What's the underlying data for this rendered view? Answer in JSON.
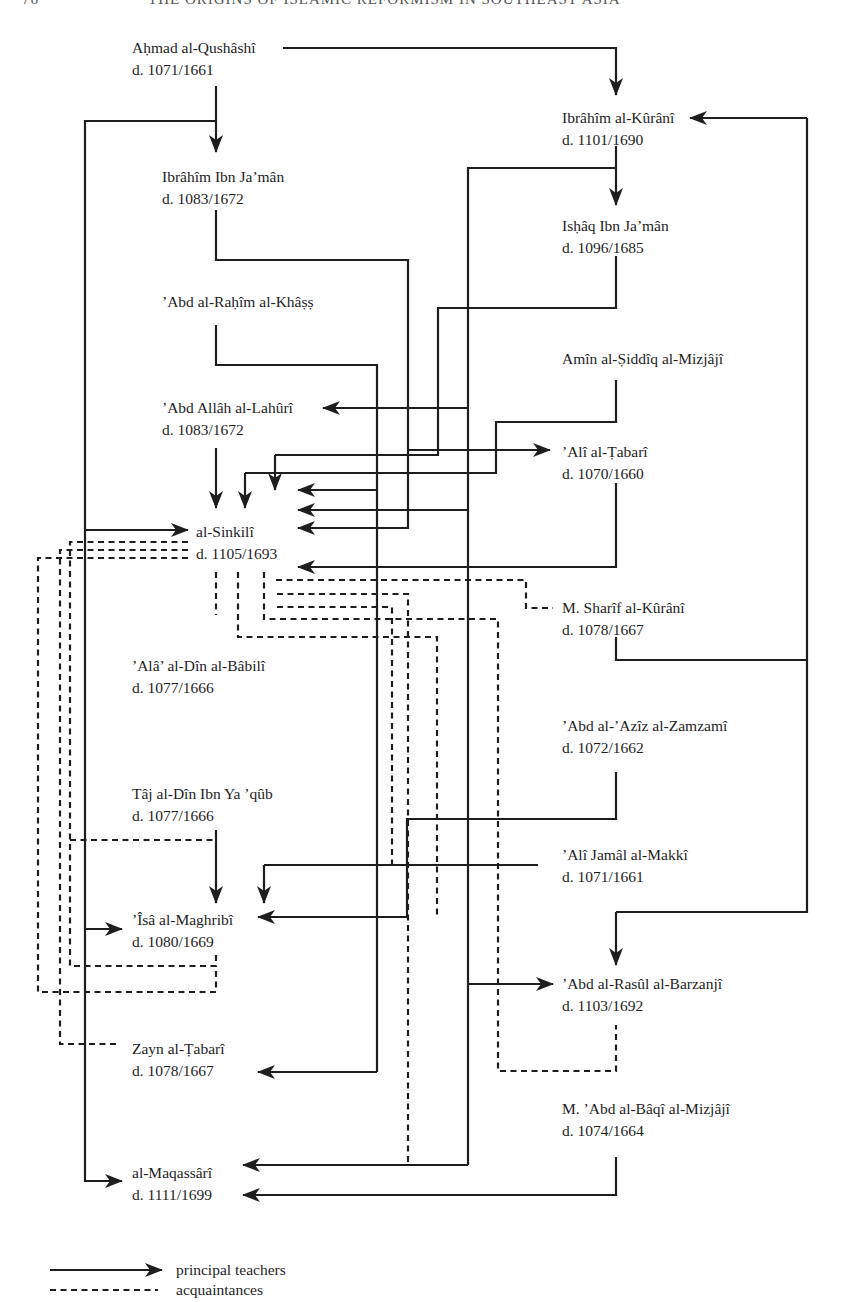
{
  "page_header": {
    "page_number": "76",
    "running_title": "THE ORIGINS OF ISLAMIC REFORMISM IN SOUTHEAST ASIA"
  },
  "nodes": {
    "qushashi": {
      "name": "Aḥmad al-Qushâshî",
      "death": "d. 1071/1661"
    },
    "ibrahim_kurani": {
      "name": "Ibrâhîm al-Kûrânî",
      "death": "d. 1101/1690"
    },
    "ibrahim_ibn_jaman": {
      "name": "Ibrâhîm Ibn Ja’mân",
      "death": "d. 1083/1672"
    },
    "ishaq_ibn_jaman": {
      "name": "Isḥâq Ibn Ja’mân",
      "death": "d. 1096/1685"
    },
    "abd_rahim_khass": {
      "name": "’Abd al-Raḥîm al-Khâṣṣ",
      "death": ""
    },
    "amin_mizjaji": {
      "name": "Amîn al-Ṣiddîq al-Mizjâjî",
      "death": ""
    },
    "abd_allah_lahuri": {
      "name": "’Abd Allâh al-Lahûrî",
      "death": "d. 1083/1672"
    },
    "ali_tabari": {
      "name": "’Alî al-Ṭabarî",
      "death": "d. 1070/1660"
    },
    "sinkili": {
      "name": "al-Sinkilî",
      "death": "d. 1105/1693"
    },
    "sharif_kurani": {
      "name": "M. Sharîf al-Kûrânî",
      "death": "d. 1078/1667"
    },
    "ala_babili": {
      "name": "’Alâ’ al-Dîn al-Bâbilî",
      "death": "d. 1077/1666"
    },
    "abd_aziz_zamzami": {
      "name": "’Abd al-’Azîz al-Zamzamî",
      "death": "d. 1072/1662"
    },
    "taj_ibn_yaqub": {
      "name": "Tâj al-Dîn Ibn Ya ’qûb",
      "death": "d. 1077/1666"
    },
    "ali_jamal_makki": {
      "name": "’Alî Jamâl al-Makkî",
      "death": "d. 1071/1661"
    },
    "isa_maghribi": {
      "name": "’Îsâ al-Maghribî",
      "death": "d. 1080/1669"
    },
    "abd_rasul_barzanji": {
      "name": "’Abd al-Rasûl al-Barzanjî",
      "death": "d. 1103/1692"
    },
    "zayn_tabari": {
      "name": "Zayn al-Ṭabarî",
      "death": "d. 1078/1667"
    },
    "abd_baqi_mizjaji": {
      "name": "M. ’Abd al-Bâqî al-Mizjâjî",
      "death": "d. 1074/1664"
    },
    "maqassari": {
      "name": "al-Maqassârî",
      "death": "d. 1111/1699"
    }
  },
  "relations": {
    "principal_teachers": [
      [
        "qushashi",
        "ibrahim_kurani"
      ],
      [
        "qushashi",
        "ibrahim_ibn_jaman"
      ],
      [
        "qushashi",
        "sinkili"
      ],
      [
        "qushashi",
        "isa_maghribi"
      ],
      [
        "qushashi",
        "maqassari"
      ],
      [
        "ibrahim_kurani",
        "ishaq_ibn_jaman"
      ],
      [
        "ibrahim_kurani",
        "sinkili"
      ],
      [
        "ibrahim_kurani",
        "abd_allah_lahuri"
      ],
      [
        "ibrahim_ibn_jaman",
        "sinkili"
      ],
      [
        "ishaq_ibn_jaman",
        "sinkili"
      ],
      [
        "abd_rahim_khass",
        "sinkili"
      ],
      [
        "abd_rahim_khass",
        "zayn_tabari"
      ],
      [
        "amin_mizjaji",
        "sinkili"
      ],
      [
        "abd_allah_lahuri",
        "sinkili"
      ],
      [
        "ali_tabari",
        "sinkili"
      ],
      [
        "sharif_kurani",
        "ibrahim_kurani"
      ],
      [
        "sharif_kurani",
        "abd_rasul_barzanji"
      ],
      [
        "abd_aziz_zamzami",
        "isa_maghribi"
      ],
      [
        "ali_jamal_makki",
        "isa_maghribi"
      ],
      [
        "taj_ibn_yaqub",
        "isa_maghribi"
      ],
      [
        "abd_baqi_mizjaji",
        "maqassari"
      ]
    ],
    "acquaintances": [
      [
        "sinkili",
        "ala_babili"
      ],
      [
        "sinkili",
        "sharif_kurani"
      ],
      [
        "sinkili",
        "isa_maghribi"
      ],
      [
        "sinkili",
        "zayn_tabari"
      ],
      [
        "sinkili",
        "abd_rasul_barzanji"
      ],
      [
        "sinkili",
        "maqassari"
      ],
      [
        "isa_maghribi",
        "taj_ibn_yaqub"
      ]
    ]
  },
  "legend": {
    "principal": "principal teachers",
    "acquaintance": "acquaintances"
  }
}
